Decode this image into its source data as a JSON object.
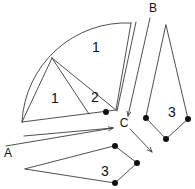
{
  "figure": {
    "background_color": "#ffffff",
    "stroke_color": "#3c3c3c",
    "dot_color": "#111111",
    "width": 195,
    "height": 189
  },
  "region_labels": [
    {
      "text": "1",
      "x": 96,
      "y": 48
    },
    {
      "text": "1",
      "x": 55,
      "y": 99
    },
    {
      "text": "2",
      "x": 95,
      "y": 98
    },
    {
      "text": "3",
      "x": 172,
      "y": 113
    },
    {
      "text": "3",
      "x": 105,
      "y": 172
    }
  ],
  "point_labels": [
    {
      "text": "B",
      "x": 153,
      "y": 9
    },
    {
      "text": "C",
      "x": 124,
      "y": 124
    },
    {
      "text": "A",
      "x": 8,
      "y": 154
    }
  ],
  "vertex_dots": [
    {
      "x": 106,
      "y": 112,
      "r": 3.0
    },
    {
      "x": 146,
      "y": 118,
      "r": 3.0
    },
    {
      "x": 188,
      "y": 119,
      "r": 3.0
    },
    {
      "x": 166,
      "y": 139,
      "r": 3.0
    },
    {
      "x": 115,
      "y": 146,
      "r": 3.0
    },
    {
      "x": 137,
      "y": 163,
      "r": 3.0
    },
    {
      "x": 115,
      "y": 183,
      "r": 3.0
    }
  ],
  "shapes": {
    "sector_outline": "M 22 122 L 22 122 A 104 104 0 0 1 131 23 L 116 110 Z",
    "sector_arc": "M 22 122 A 104 104 0 0 1 131 23",
    "sector_right_edge": "M 131 23 L 116 110",
    "sector_bottom_edge": "M 22 122 L 116 110",
    "divider_a": "M 52 58 L 116 110",
    "divider_b": "M 52 58 L 89 114",
    "divider_c": "M 52 58 L 22 122",
    "kite_right": "M 166 25 L 188 119 L 166 139 L 146 118 Z",
    "pentagon_bottom": "M 115 146 L 137 163 L 115 183 L 25 169 Z"
  },
  "arrows": {
    "a_to_c_label": "arrow-from-A-toward-C",
    "a_to_c_path": "M 6 146 L 113 128",
    "a_to_c_upper_path": "M 24 136 L 113 128",
    "b_to_c_label": "arrow-from-B-toward-C",
    "b_to_c_path": "M 150 18 L 128 116",
    "b_to_c_second_path": "M 135 22 L 116 112",
    "c_outgoing_path": "M 130 129 L 152 152"
  },
  "icons": {
    "arrowhead": "arrowhead-icon",
    "vertex": "vertex-dot-icon"
  }
}
